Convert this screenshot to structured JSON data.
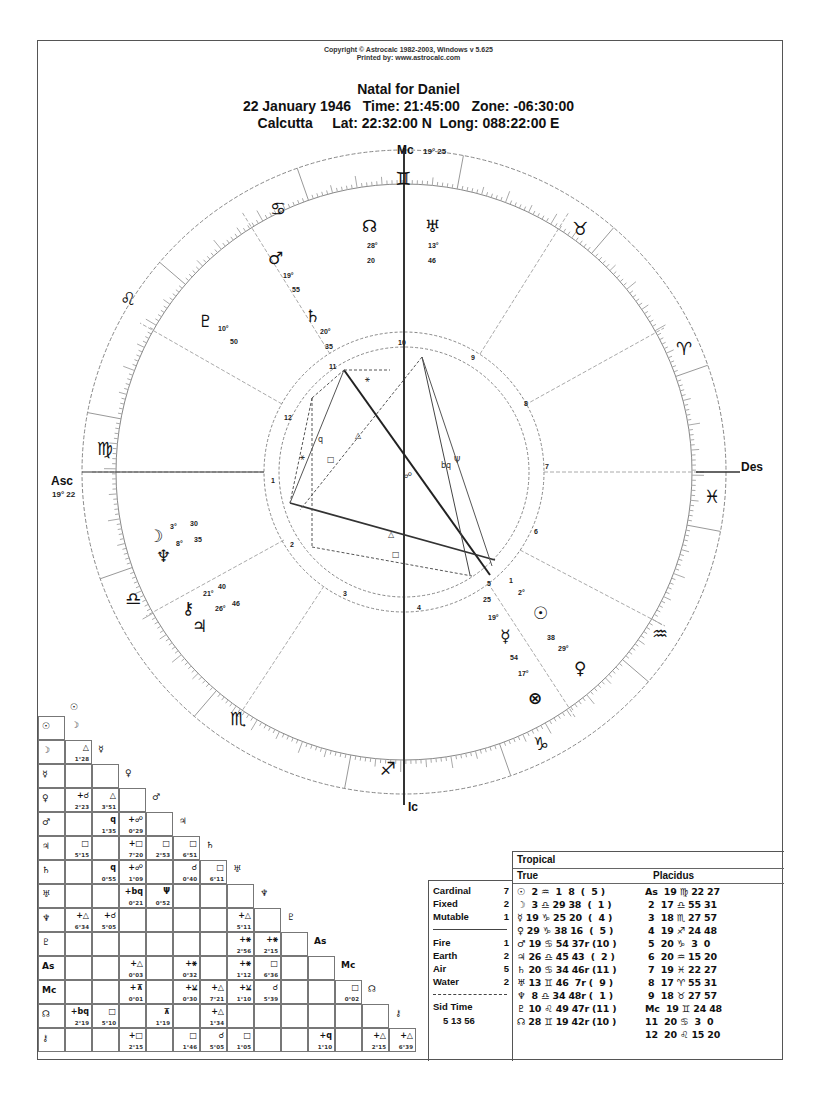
{
  "header": {
    "copyright": "Copyright © Astrocalc 1982-2003, Windows v 5.625",
    "printed_by": "Printed by: www.astrocalc.com",
    "title": "Natal for Daniel",
    "line1": "22 January 1946   Time: 21:45:00   Zone: -06:30:00",
    "line2": "Calcutta     Lat: 22:32:00 N  Long: 088:22:00 E"
  },
  "axes": {
    "mc": {
      "label": "Mc",
      "deg": "19° 25"
    },
    "asc": {
      "label": "Asc",
      "deg": "19° 22"
    },
    "des": {
      "label": "Des"
    },
    "ic": {
      "label": "Ic"
    }
  },
  "signs": [
    {
      "name": "gemini",
      "glyph": "♊"
    },
    {
      "name": "taurus",
      "glyph": "♉"
    },
    {
      "name": "aries",
      "glyph": "♈"
    },
    {
      "name": "pisces",
      "glyph": "♓"
    },
    {
      "name": "aquarius",
      "glyph": "♒"
    },
    {
      "name": "capricorn",
      "glyph": "♑"
    },
    {
      "name": "sagittarius",
      "glyph": "♐"
    },
    {
      "name": "scorpio",
      "glyph": "♏"
    },
    {
      "name": "libra",
      "glyph": "♎"
    },
    {
      "name": "virgo",
      "glyph": "♍"
    },
    {
      "name": "leo",
      "glyph": "♌"
    },
    {
      "name": "cancer",
      "glyph": "♋"
    }
  ],
  "wheel_planets": [
    {
      "name": "node",
      "glyph": "☊",
      "deg": "28°",
      "min": "20"
    },
    {
      "name": "uranus",
      "glyph": "♅",
      "deg": "13°",
      "min": "46"
    },
    {
      "name": "mars",
      "glyph": "♂",
      "deg": "19°",
      "min": "55"
    },
    {
      "name": "saturn",
      "glyph": "♄",
      "deg": "20°",
      "min": "35"
    },
    {
      "name": "pluto",
      "glyph": "♇",
      "deg": "10°",
      "min": "50"
    },
    {
      "name": "moon",
      "glyph": "☽",
      "deg": "3°",
      "min": "30"
    },
    {
      "name": "neptune",
      "glyph": "♆",
      "deg": "8°",
      "min": "35"
    },
    {
      "name": "chiron",
      "glyph": "⚷",
      "deg": "21°",
      "min": "40"
    },
    {
      "name": "jupiter",
      "glyph": "♃",
      "deg": "26°",
      "min": "46"
    },
    {
      "name": "sun",
      "glyph": "☉",
      "deg": "2°",
      "min": "1"
    },
    {
      "name": "venus",
      "glyph": "♀",
      "deg": "29°",
      "min": "38"
    },
    {
      "name": "mercury",
      "glyph": "☿",
      "deg": "19°",
      "min": "25"
    },
    {
      "name": "mercury2",
      "glyph": "",
      "deg": "17°",
      "min": "54"
    },
    {
      "name": "part-of-fortune",
      "glyph": "⊗",
      "deg": "",
      "min": ""
    }
  ],
  "house_numbers": [
    "1",
    "2",
    "3",
    "4",
    "5",
    "6",
    "7",
    "8",
    "9",
    "10",
    "11",
    "12"
  ],
  "aspect_grid": {
    "col_labels": [
      "☉",
      "☽",
      "☿",
      "♀",
      "♂",
      "♃",
      "♄",
      "♅",
      "♆",
      "♇",
      "As",
      "Mc",
      "☊",
      "⚷"
    ],
    "rows": [
      {
        "label": "☉",
        "cells": []
      },
      {
        "label": "☽",
        "cells": [
          {
            "sym": "△",
            "orb": "1°28"
          }
        ]
      },
      {
        "label": "☿",
        "cells": [
          {
            "sym": "",
            "orb": ""
          },
          {
            "sym": "",
            "orb": ""
          }
        ]
      },
      {
        "label": "♀",
        "cells": [
          {
            "sym": "+☌",
            "orb": "2°23"
          },
          {
            "sym": "△",
            "orb": "3°51"
          },
          {
            "sym": "",
            "orb": ""
          }
        ]
      },
      {
        "label": "♂",
        "cells": [
          {
            "sym": "",
            "orb": ""
          },
          {
            "sym": "q",
            "orb": "1°35"
          },
          {
            "sym": "+☍",
            "orb": "0°29"
          },
          {
            "sym": "",
            "orb": ""
          }
        ]
      },
      {
        "label": "♃",
        "cells": [
          {
            "sym": "□",
            "orb": "5°15"
          },
          {
            "sym": "",
            "orb": ""
          },
          {
            "sym": "+□",
            "orb": "7°20"
          },
          {
            "sym": "□",
            "orb": "2°53"
          },
          {
            "sym": "□",
            "orb": "6°51"
          }
        ]
      },
      {
        "label": "♄",
        "cells": [
          {
            "sym": "",
            "orb": ""
          },
          {
            "sym": "q",
            "orb": "0°55"
          },
          {
            "sym": "+☍",
            "orb": "1°09"
          },
          {
            "sym": "",
            "orb": ""
          },
          {
            "sym": "☌",
            "orb": "0°40"
          },
          {
            "sym": "□",
            "orb": "6°11"
          }
        ]
      },
      {
        "label": "♅",
        "cells": [
          {
            "sym": "",
            "orb": ""
          },
          {
            "sym": "",
            "orb": ""
          },
          {
            "sym": "+bq",
            "orb": "0°21"
          },
          {
            "sym": "Ψ",
            "orb": "0°52"
          },
          {
            "sym": "",
            "orb": ""
          },
          {
            "sym": "",
            "orb": ""
          },
          {
            "sym": "",
            "orb": ""
          }
        ]
      },
      {
        "label": "♆",
        "cells": [
          {
            "sym": "+△",
            "orb": "6°34"
          },
          {
            "sym": "+☌",
            "orb": "5°05"
          },
          {
            "sym": "",
            "orb": ""
          },
          {
            "sym": "",
            "orb": ""
          },
          {
            "sym": "",
            "orb": ""
          },
          {
            "sym": "",
            "orb": ""
          },
          {
            "sym": "+△",
            "orb": "5°11"
          },
          {
            "sym": "",
            "orb": ""
          }
        ]
      },
      {
        "label": "♇",
        "cells": [
          {
            "sym": "",
            "orb": ""
          },
          {
            "sym": "",
            "orb": ""
          },
          {
            "sym": "",
            "orb": ""
          },
          {
            "sym": "",
            "orb": ""
          },
          {
            "sym": "",
            "orb": ""
          },
          {
            "sym": "",
            "orb": ""
          },
          {
            "sym": "+⚹",
            "orb": "2°56"
          },
          {
            "sym": "+⚹",
            "orb": "2°15"
          },
          {
            "sym": "",
            "orb": ""
          }
        ]
      },
      {
        "label": "As",
        "cells": [
          {
            "sym": "",
            "orb": ""
          },
          {
            "sym": "",
            "orb": ""
          },
          {
            "sym": "+△",
            "orb": "0°03"
          },
          {
            "sym": "",
            "orb": ""
          },
          {
            "sym": "+⚹",
            "orb": "0°32"
          },
          {
            "sym": "",
            "orb": ""
          },
          {
            "sym": "+⚹",
            "orb": "1°12"
          },
          {
            "sym": "□",
            "orb": "6°36"
          },
          {
            "sym": "",
            "orb": ""
          },
          {
            "sym": "",
            "orb": ""
          }
        ]
      },
      {
        "label": "Mc",
        "cells": [
          {
            "sym": "",
            "orb": ""
          },
          {
            "sym": "",
            "orb": ""
          },
          {
            "sym": "+⊼",
            "orb": "0°01"
          },
          {
            "sym": "",
            "orb": ""
          },
          {
            "sym": "+⚺",
            "orb": "0°30"
          },
          {
            "sym": "+△",
            "orb": "7°21"
          },
          {
            "sym": "+⚺",
            "orb": "1°10"
          },
          {
            "sym": "☌",
            "orb": "5°39"
          },
          {
            "sym": "",
            "orb": ""
          },
          {
            "sym": "",
            "orb": ""
          },
          {
            "sym": "□",
            "orb": "0°02"
          }
        ]
      },
      {
        "label": "☊",
        "cells": [
          {
            "sym": "+bq",
            "orb": "2°19"
          },
          {
            "sym": "□",
            "orb": "5°10"
          },
          {
            "sym": "",
            "orb": ""
          },
          {
            "sym": "⊼",
            "orb": "1°19"
          },
          {
            "sym": "",
            "orb": ""
          },
          {
            "sym": "+△",
            "orb": "1°34"
          },
          {
            "sym": "",
            "orb": ""
          },
          {
            "sym": "",
            "orb": ""
          },
          {
            "sym": "",
            "orb": ""
          },
          {
            "sym": "",
            "orb": ""
          },
          {
            "sym": "",
            "orb": ""
          },
          {
            "sym": "",
            "orb": ""
          }
        ]
      },
      {
        "label": "⚷",
        "cells": [
          {
            "sym": "",
            "orb": ""
          },
          {
            "sym": "",
            "orb": ""
          },
          {
            "sym": "+□",
            "orb": "2°15"
          },
          {
            "sym": "",
            "orb": ""
          },
          {
            "sym": "□",
            "orb": "1°46"
          },
          {
            "sym": "☌",
            "orb": "5°05"
          },
          {
            "sym": "□",
            "orb": "1°05"
          },
          {
            "sym": "",
            "orb": ""
          },
          {
            "sym": "",
            "orb": ""
          },
          {
            "sym": "+q",
            "orb": "1°10"
          },
          {
            "sym": "",
            "orb": ""
          },
          {
            "sym": "+△",
            "orb": "2°15"
          },
          {
            "sym": "+△",
            "orb": "6°39"
          }
        ]
      }
    ]
  },
  "stats": {
    "modes": [
      {
        "label": "Cardinal",
        "value": "7"
      },
      {
        "label": "Fixed",
        "value": "2"
      },
      {
        "label": "Mutable",
        "value": "1"
      }
    ],
    "elements": [
      {
        "label": "Fire",
        "value": "1"
      },
      {
        "label": "Earth",
        "value": "2"
      },
      {
        "label": "Air",
        "value": "5"
      },
      {
        "label": "Water",
        "value": "2"
      }
    ],
    "sid_time_label": "Sid Time",
    "sid_time_value": "5 13 56"
  },
  "positions": {
    "zodiac": "Tropical",
    "node_type": "True",
    "house_system": "Placidus",
    "planets": [
      "☉  2 ♒  1  8  (  5 )",
      "☽  3 ♎ 29 38  (  1 )",
      "☿ 19 ♑ 25 20  (  4 )",
      "♀ 29 ♑ 38 16  (  5 )",
      "♂ 19 ♋ 54 37r (10 )",
      "♃ 26 ♎ 45 43  (  2 )",
      "♄ 20 ♋ 34 46r (11 )",
      "♅ 13 ♊ 46  7r (  9 )",
      "♆  8 ♎ 34 48r (  1 )",
      "♇ 10 ♌ 49 47r (11 )",
      "☊ 28 ♊ 19 42r (10 )"
    ],
    "houses": [
      "As  19 ♍ 22 27",
      " 2  17 ♎ 55 31",
      " 3  18 ♏ 27 57",
      " 4  19 ♐ 24 48",
      " 5  20 ♑  3  0",
      " 6  20 ♒ 15 20",
      " 7  19 ♓ 22 27",
      " 8  17 ♈ 55 31",
      " 9  18 ♉ 27 57",
      "Mc  19 ♊ 24 48",
      "11  20 ♋  3  0",
      "12  20 ♌ 15 20"
    ]
  },
  "colors": {
    "ink": "#111111",
    "line": "#777777",
    "paper": "#ffffff"
  }
}
